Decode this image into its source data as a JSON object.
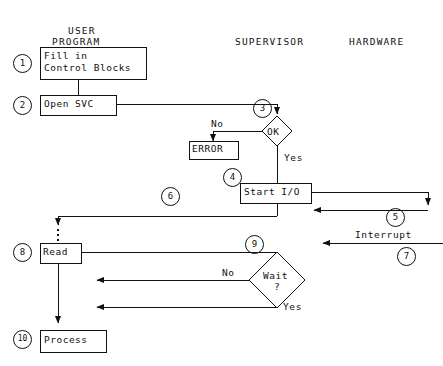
{
  "diagram": {
    "columns": [
      {
        "id": "user-program",
        "label_line1": "USER",
        "label_line2": "PROGRAM"
      },
      {
        "id": "supervisor",
        "label": "SUPERVISOR"
      },
      {
        "id": "hardware",
        "label": "HARDWARE"
      }
    ],
    "nodes": [
      {
        "id": "fill-in-control-blocks",
        "step": "1",
        "shape": "box",
        "text": "Fill in\nControl Blocks"
      },
      {
        "id": "open-svc",
        "step": "2",
        "shape": "box",
        "text": "Open SVC"
      },
      {
        "id": "ok-decision",
        "step": "3",
        "shape": "diamond",
        "text": "OK"
      },
      {
        "id": "error",
        "step": "",
        "shape": "box",
        "text": "ERROR"
      },
      {
        "id": "start-io",
        "step": "4",
        "shape": "box",
        "text": "Start I/O"
      },
      {
        "id": "read",
        "step": "8",
        "shape": "box",
        "text": "Read"
      },
      {
        "id": "wait-decision",
        "step": "9",
        "shape": "diamond",
        "text_line1": "Wait",
        "text_line2": "?"
      },
      {
        "id": "process",
        "step": "10",
        "shape": "box",
        "text": "Process"
      }
    ],
    "edge_labels": [
      {
        "id": "ok-no",
        "text": "No"
      },
      {
        "id": "ok-yes",
        "text": "Yes"
      },
      {
        "id": "wait-no",
        "text": "No"
      },
      {
        "id": "wait-yes",
        "text": "Yes"
      },
      {
        "id": "interrupt",
        "text": "Interrupt"
      }
    ],
    "step_markers": [
      {
        "id": "marker-1",
        "text": "1"
      },
      {
        "id": "marker-2",
        "text": "2"
      },
      {
        "id": "marker-3",
        "text": "3"
      },
      {
        "id": "marker-4",
        "text": "4"
      },
      {
        "id": "marker-5",
        "text": "5"
      },
      {
        "id": "marker-6",
        "text": "6"
      },
      {
        "id": "marker-7",
        "text": "7"
      },
      {
        "id": "marker-8",
        "text": "8"
      },
      {
        "id": "marker-9",
        "text": "9"
      },
      {
        "id": "marker-10",
        "text": "10"
      }
    ],
    "colors": {
      "ink": "#111111",
      "paper": "#ffffff"
    }
  }
}
